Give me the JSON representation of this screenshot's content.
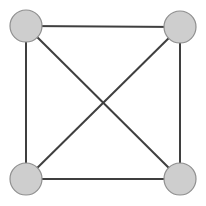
{
  "figure": {
    "background_color": "#ffffff",
    "width": 206,
    "height": 206
  },
  "style": {
    "node_fill": "#cecece",
    "node_stroke": "#8f8f8f",
    "node_stroke_width": 1.2,
    "node_radius": 16,
    "edge_color": "#3f3f3f",
    "edge_width": 2
  },
  "chart_data": {
    "type": "diagram",
    "graph_type": "complete-graph-k4",
    "node_count": 4,
    "edge_count": 6,
    "nodes": [
      {
        "id": "n1",
        "label": "",
        "x": 26,
        "y": 26,
        "position": "top-left"
      },
      {
        "id": "n2",
        "label": "",
        "x": 180,
        "y": 27,
        "position": "top-right"
      },
      {
        "id": "n3",
        "label": "",
        "x": 26,
        "y": 179,
        "position": "bottom-left"
      },
      {
        "id": "n4",
        "label": "",
        "x": 180,
        "y": 179,
        "position": "bottom-right"
      }
    ],
    "edges": [
      {
        "id": "e1",
        "from": "n1",
        "to": "n2",
        "kind": "side",
        "name": "top-edge"
      },
      {
        "id": "e2",
        "from": "n1",
        "to": "n3",
        "kind": "side",
        "name": "left-edge"
      },
      {
        "id": "e3",
        "from": "n2",
        "to": "n4",
        "kind": "side",
        "name": "right-edge"
      },
      {
        "id": "e4",
        "from": "n3",
        "to": "n4",
        "kind": "side",
        "name": "bottom-edge"
      },
      {
        "id": "e5",
        "from": "n1",
        "to": "n4",
        "kind": "diagonal",
        "name": "diagonal-tl-br"
      },
      {
        "id": "e6",
        "from": "n2",
        "to": "n3",
        "kind": "diagonal",
        "name": "diagonal-tr-bl"
      }
    ],
    "crossing_point": {
      "x": 103,
      "y": 103
    }
  }
}
